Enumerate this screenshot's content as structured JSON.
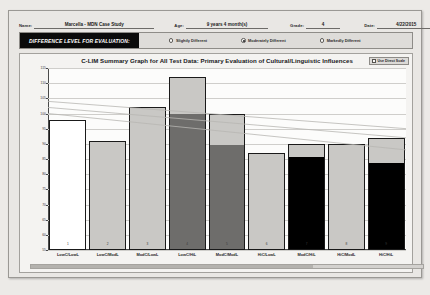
{
  "header": {
    "name_label": "Name:",
    "name_value": "Marcella - MDN Case Study",
    "age_label": "Age:",
    "age_value": "9 years 4 month(s)",
    "grade_label": "Grade:",
    "grade_value": "4",
    "date_label": "Date:",
    "date_value": "4/22/2015"
  },
  "difference_panel": {
    "title": "DIFFERENCE LEVEL FOR EVALUATION:",
    "options": [
      {
        "label": "Slightly Different",
        "selected": false
      },
      {
        "label": "Moderately Different",
        "selected": true
      },
      {
        "label": "Markedly Different",
        "selected": false
      }
    ]
  },
  "chart_panel": {
    "title": "C-LIM Summary Graph for All Test Data: Primary Evaluation of Cultural/Linguistic Influences",
    "scale_toggle_label": "Use Direct Scale",
    "scale_toggle_checked": false
  },
  "colors": {
    "bar_white": "#ffffff",
    "bar_light": "#c9c8c5",
    "bar_mid": "#6e6d6b",
    "bar_dark": "#000000",
    "bar_outline": "#1a1a1a",
    "grid": "#cfcecb",
    "axis": "#4a4a4a",
    "panel": "#e9e7e4",
    "title_bar": "#0b0b0b"
  },
  "chart_data": {
    "type": "bar",
    "title": "C-LIM Summary Graph for All Test Data: Primary Evaluation of Cultural/Linguistic Influences",
    "xlabel": "",
    "ylabel": "",
    "ylim": [
      55,
      115
    ],
    "yticks": [
      115,
      110,
      105,
      100,
      95,
      90,
      85,
      80,
      75,
      70,
      65,
      60,
      55
    ],
    "grid": true,
    "legend": "none",
    "categories": [
      "LowC/LowL",
      "LowC/ModL",
      "ModC/LowL",
      "LowC/HiL",
      "ModC/ModL",
      "HiC/LowL",
      "ModC/HiL",
      "HiC/ModL",
      "HiC/HiL"
    ],
    "cell_numbers": [
      "1",
      "2",
      "3",
      "4",
      "5",
      "6",
      "7",
      "8",
      "9"
    ],
    "values": [
      98,
      91,
      102,
      112,
      100,
      87,
      90,
      90,
      92
    ],
    "bar_bottom_values": [
      55,
      55,
      55,
      55,
      55,
      55,
      55,
      55,
      55
    ],
    "series": [
      {
        "name": "Expected range (upper segment)",
        "values": [
          98,
          91,
          102,
          112,
          100,
          87,
          90,
          90,
          92
        ],
        "segment_breaks": [
          98,
          88,
          97,
          100,
          90,
          84,
          86,
          82,
          84
        ]
      }
    ],
    "bar_shades": [
      "white",
      "light",
      "light",
      "mid",
      "mid",
      "light",
      "dark",
      "light",
      "dark"
    ],
    "trend_lines": [
      {
        "name": "upper-expected",
        "from": [
          0,
          104
        ],
        "to": [
          9,
          95
        ]
      },
      {
        "name": "mid-expected",
        "from": [
          0,
          102
        ],
        "to": [
          9,
          92
        ]
      },
      {
        "name": "lower-expected",
        "from": [
          0,
          100
        ],
        "to": [
          9,
          88
        ]
      }
    ]
  }
}
